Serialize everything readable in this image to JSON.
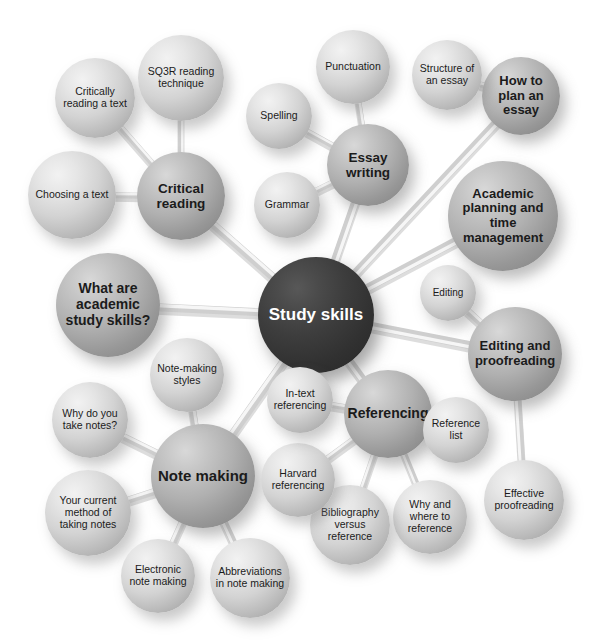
{
  "diagram": {
    "title": "Study skills",
    "type": "mind-map",
    "colors": {
      "hub_fill": "#323232",
      "hub_text": "#ffffff",
      "branch_fill": "#a9a9a9",
      "leaf_fill": "#d0d0d0",
      "text": "#1b1b1b",
      "background": "#ffffff",
      "connector": "#d9d9d9"
    }
  },
  "hub": {
    "label": "Study skills",
    "cx": 316,
    "cy": 315,
    "r": 58,
    "font": 17,
    "tone": "hub",
    "weight": "bold"
  },
  "branches": [
    {
      "id": "critical-reading",
      "label": "Critical reading",
      "cx": 181,
      "cy": 196,
      "r": 44,
      "font": 13.5,
      "tone": "mid",
      "weight": "bold"
    },
    {
      "id": "essay-writing",
      "label": "Essay writing",
      "cx": 368,
      "cy": 165,
      "r": 41,
      "font": 13.5,
      "tone": "mid",
      "weight": "bold"
    },
    {
      "id": "how-to-plan-an-essay",
      "label": "How to plan an essay",
      "cx": 521,
      "cy": 96,
      "r": 39,
      "font": 13,
      "tone": "mid",
      "weight": "bold"
    },
    {
      "id": "academic-planning",
      "label": "Academic planning and time management",
      "cx": 503,
      "cy": 216,
      "r": 55,
      "font": 13,
      "tone": "mid",
      "weight": "bold"
    },
    {
      "id": "editing-proofreading",
      "label": "Editing and proofreading",
      "cx": 515,
      "cy": 354,
      "r": 47,
      "font": 13,
      "tone": "mid",
      "weight": "bold"
    },
    {
      "id": "referencing",
      "label": "Referencing",
      "cx": 388,
      "cy": 414,
      "r": 44,
      "font": 14,
      "tone": "mid",
      "weight": "bold"
    },
    {
      "id": "note-making",
      "label": "Note making",
      "cx": 203,
      "cy": 476,
      "r": 52,
      "font": 15,
      "tone": "mid",
      "weight": "bold"
    },
    {
      "id": "what-are-academic",
      "label": "What are academic study skills?",
      "cx": 108,
      "cy": 305,
      "r": 52,
      "font": 14,
      "tone": "mid",
      "weight": "bold"
    }
  ],
  "leaves": [
    {
      "id": "critically-reading-a-text",
      "label": "Critically reading a text",
      "cx": 95,
      "cy": 98,
      "r": 40,
      "font": 10.5,
      "tone": "light",
      "weight": "norm"
    },
    {
      "id": "sq3r-reading-technique",
      "label": "SQ3R reading technique",
      "cx": 181,
      "cy": 78,
      "r": 43,
      "font": 10.5,
      "tone": "light",
      "weight": "norm"
    },
    {
      "id": "choosing-a-text",
      "label": "Choosing a text",
      "cx": 72,
      "cy": 195,
      "r": 44,
      "font": 10.5,
      "tone": "light",
      "weight": "norm"
    },
    {
      "id": "spelling",
      "label": "Spelling",
      "cx": 279,
      "cy": 116,
      "r": 33,
      "font": 10.5,
      "tone": "light",
      "weight": "norm"
    },
    {
      "id": "grammar",
      "label": "Grammar",
      "cx": 287,
      "cy": 205,
      "r": 33,
      "font": 10.5,
      "tone": "light",
      "weight": "norm"
    },
    {
      "id": "punctuation",
      "label": "Punctuation",
      "cx": 353,
      "cy": 67,
      "r": 37,
      "font": 10.5,
      "tone": "light",
      "weight": "norm"
    },
    {
      "id": "structure-of-an-essay",
      "label": "Structure of an essay",
      "cx": 447,
      "cy": 75,
      "r": 35,
      "font": 10.5,
      "tone": "light",
      "weight": "norm"
    },
    {
      "id": "editing",
      "label": "Editing",
      "cx": 448,
      "cy": 293,
      "r": 28,
      "font": 10,
      "tone": "light",
      "weight": "norm"
    },
    {
      "id": "effective-proofreading",
      "label": "Effective proofreading",
      "cx": 524,
      "cy": 500,
      "r": 40,
      "font": 10.5,
      "tone": "light",
      "weight": "norm"
    },
    {
      "id": "reference-list",
      "label": "Reference list",
      "cx": 456,
      "cy": 430,
      "r": 33,
      "font": 10.5,
      "tone": "light",
      "weight": "norm"
    },
    {
      "id": "why-and-where-to-reference",
      "label": "Why and where to reference",
      "cx": 430,
      "cy": 517,
      "r": 37,
      "font": 10.5,
      "tone": "light",
      "weight": "norm"
    },
    {
      "id": "bibliography-versus-reference",
      "label": "Bibliography versus reference",
      "cx": 350,
      "cy": 525,
      "r": 40,
      "font": 10.5,
      "tone": "light",
      "weight": "norm"
    },
    {
      "id": "harvard-referencing",
      "label": "Harvard referencing",
      "cx": 298,
      "cy": 480,
      "r": 37,
      "font": 10.5,
      "tone": "light",
      "weight": "norm"
    },
    {
      "id": "in-text-referencing",
      "label": "In-text referencing",
      "cx": 300,
      "cy": 400,
      "r": 33,
      "font": 10.5,
      "tone": "light",
      "weight": "norm"
    },
    {
      "id": "note-making-styles",
      "label": "Note-making styles",
      "cx": 187,
      "cy": 375,
      "r": 37,
      "font": 10.5,
      "tone": "light",
      "weight": "norm"
    },
    {
      "id": "why-do-you-take-notes",
      "label": "Why do you take notes?",
      "cx": 90,
      "cy": 420,
      "r": 38,
      "font": 10.5,
      "tone": "light",
      "weight": "norm"
    },
    {
      "id": "your-current-method",
      "label": "Your current method of taking notes",
      "cx": 88,
      "cy": 513,
      "r": 43,
      "font": 10.5,
      "tone": "light",
      "weight": "norm"
    },
    {
      "id": "electronic-note-making",
      "label": "Electronic note making",
      "cx": 158,
      "cy": 576,
      "r": 37,
      "font": 10.5,
      "tone": "light",
      "weight": "norm"
    },
    {
      "id": "abbreviations-in-note-making",
      "label": "Abbreviations in note making",
      "cx": 250,
      "cy": 578,
      "r": 40,
      "font": 10.5,
      "tone": "light",
      "weight": "norm"
    }
  ],
  "edges": [
    {
      "from": "hub",
      "to": "critical-reading"
    },
    {
      "from": "hub",
      "to": "essay-writing"
    },
    {
      "from": "hub",
      "to": "how-to-plan-an-essay"
    },
    {
      "from": "hub",
      "to": "academic-planning"
    },
    {
      "from": "hub",
      "to": "editing-proofreading"
    },
    {
      "from": "hub",
      "to": "referencing"
    },
    {
      "from": "hub",
      "to": "note-making"
    },
    {
      "from": "hub",
      "to": "what-are-academic"
    },
    {
      "from": "critical-reading",
      "to": "critically-reading-a-text"
    },
    {
      "from": "critical-reading",
      "to": "sq3r-reading-technique"
    },
    {
      "from": "critical-reading",
      "to": "choosing-a-text"
    },
    {
      "from": "essay-writing",
      "to": "spelling"
    },
    {
      "from": "essay-writing",
      "to": "grammar"
    },
    {
      "from": "essay-writing",
      "to": "punctuation"
    },
    {
      "from": "how-to-plan-an-essay",
      "to": "structure-of-an-essay"
    },
    {
      "from": "editing-proofreading",
      "to": "editing"
    },
    {
      "from": "editing-proofreading",
      "to": "effective-proofreading"
    },
    {
      "from": "referencing",
      "to": "reference-list"
    },
    {
      "from": "referencing",
      "to": "why-and-where-to-reference"
    },
    {
      "from": "referencing",
      "to": "bibliography-versus-reference"
    },
    {
      "from": "referencing",
      "to": "harvard-referencing"
    },
    {
      "from": "referencing",
      "to": "in-text-referencing"
    },
    {
      "from": "note-making",
      "to": "note-making-styles"
    },
    {
      "from": "note-making",
      "to": "why-do-you-take-notes"
    },
    {
      "from": "note-making",
      "to": "your-current-method"
    },
    {
      "from": "note-making",
      "to": "electronic-note-making"
    },
    {
      "from": "note-making",
      "to": "abbreviations-in-note-making"
    }
  ]
}
